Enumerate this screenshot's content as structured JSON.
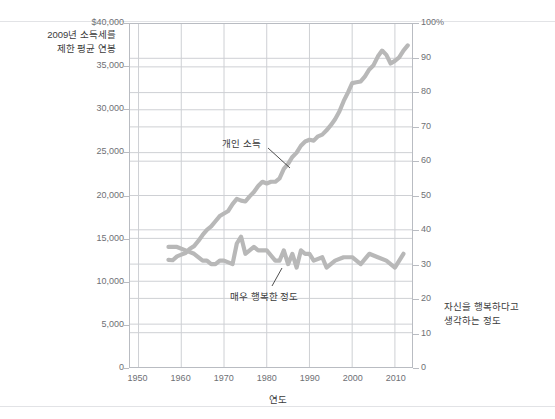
{
  "figure": {
    "left_axis_title": "2009년 소득세를\n제한 평균 연봉",
    "right_axis_title": "자신을 행복하다고\n생각하는 정도",
    "x_axis_title": "연도"
  },
  "annotations": {
    "income": "개인 소득",
    "happiness": "매우 행복한 정도"
  },
  "colors": {
    "line": "#b8b8b8",
    "grid": "#ced0d4",
    "axis": "#b9bcc2",
    "text": "#3b3b3b",
    "tick_text": "#6e7075"
  },
  "chart_data": {
    "type": "line",
    "title": "",
    "xlabel": "연도",
    "ylabel": "2009년 소득세를 제한 평균 연봉",
    "y2label": "자신을 행복하다고 생각하는 정도",
    "xlim": [
      1948,
      2014
    ],
    "xticks": [
      1950,
      1960,
      1970,
      1980,
      1990,
      2000,
      2010
    ],
    "xticklabels": [
      "1950",
      "1960",
      "1970",
      "1980",
      "1990",
      "2000",
      "2010"
    ],
    "ylim": [
      0,
      40000
    ],
    "yticks": [
      0,
      5000,
      10000,
      15000,
      20000,
      25000,
      30000,
      35000,
      40000
    ],
    "yticklabels": [
      "0",
      "5,000",
      "10,000",
      "15,000",
      "20,000",
      "25,000",
      "30,000",
      "35,000",
      "$40,000"
    ],
    "y2lim": [
      0,
      100
    ],
    "y2ticks": [
      0,
      10,
      20,
      30,
      40,
      50,
      60,
      70,
      80,
      90,
      100
    ],
    "y2ticklabels": [
      "0",
      "10",
      "20",
      "30",
      "40",
      "50",
      "60",
      "70",
      "80",
      "90",
      "100%"
    ],
    "grid": true,
    "legend": "none (inline annotations)",
    "series": [
      {
        "name": "개인 소득",
        "axis": "left",
        "unit": "2009 USD",
        "x": [
          1957,
          1958,
          1959,
          1960,
          1961,
          1962,
          1963,
          1964,
          1965,
          1966,
          1967,
          1968,
          1969,
          1970,
          1971,
          1972,
          1973,
          1974,
          1975,
          1976,
          1977,
          1978,
          1979,
          1980,
          1981,
          1982,
          1983,
          1984,
          1985,
          1986,
          1987,
          1988,
          1989,
          1990,
          1991,
          1992,
          1993,
          1994,
          1995,
          1996,
          1997,
          1998,
          1999,
          2000,
          2001,
          2002,
          2003,
          2004,
          2005,
          2006,
          2007,
          2008,
          2009,
          2010,
          2011,
          2012,
          2013
        ],
        "values": [
          12500,
          12450,
          12900,
          13100,
          13300,
          13800,
          14100,
          14700,
          15400,
          16000,
          16400,
          17000,
          17600,
          17900,
          18200,
          19000,
          19600,
          19400,
          19300,
          19900,
          20400,
          21100,
          21600,
          21400,
          21600,
          21600,
          22000,
          23100,
          23700,
          24500,
          25000,
          25800,
          26300,
          26500,
          26400,
          26900,
          27100,
          27600,
          28200,
          28900,
          29800,
          31000,
          32000,
          33100,
          33200,
          33300,
          33900,
          34700,
          35200,
          36200,
          36900,
          36400,
          35400,
          35700,
          36100,
          36900,
          37500
        ]
      },
      {
        "name": "매우 행복한 정도",
        "axis": "right",
        "unit": "percent",
        "x": [
          1957,
          1959,
          1961,
          1963,
          1965,
          1966,
          1967,
          1968,
          1969,
          1970,
          1971,
          1972,
          1973,
          1974,
          1975,
          1976,
          1977,
          1978,
          1980,
          1982,
          1983,
          1984,
          1985,
          1986,
          1987,
          1988,
          1989,
          1990,
          1991,
          1993,
          1994,
          1996,
          1998,
          2000,
          2002,
          2004,
          2006,
          2008,
          2010,
          2012
        ],
        "values": [
          35,
          35,
          34,
          33,
          31,
          31,
          30,
          30,
          31,
          31,
          30.5,
          30,
          36,
          38,
          33,
          34,
          35,
          34,
          34,
          31,
          31,
          34,
          30,
          33,
          29,
          34,
          33,
          33,
          31,
          32,
          29,
          31,
          32,
          32,
          30,
          33,
          32,
          31,
          29,
          33
        ]
      }
    ]
  }
}
